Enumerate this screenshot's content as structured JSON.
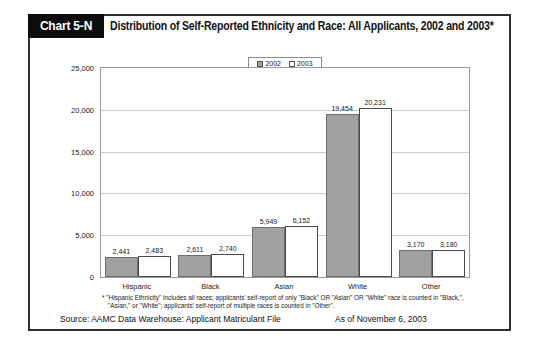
{
  "header": {
    "tab_label": "Chart 5-N",
    "title": "Distribution of Self-Reported Ethnicity and Race: All Applicants, 2002 and 2003*"
  },
  "chart_data": {
    "type": "bar",
    "categories": [
      "Hispanic",
      "Black",
      "Asian",
      "White",
      "Other"
    ],
    "series": [
      {
        "name": "2002",
        "color": "#a1a1a1",
        "values": [
          2441,
          2611,
          5949,
          19454,
          3170
        ]
      },
      {
        "name": "2003",
        "color": "#ffffff",
        "values": [
          2483,
          2740,
          6152,
          20231,
          3180
        ]
      }
    ],
    "title": "",
    "xlabel": "",
    "ylabel": "",
    "ylim": [
      0,
      25000
    ],
    "ytick_step": 5000,
    "grid": true,
    "legend_position": "top-center",
    "value_labels": true
  },
  "footnote": {
    "line1": "* \"Hispanic Ethnicity\" includes all races; applicants' self-report of only \"Black\" OR \"Asian\" OR \"White\" race is counted in \"Black,\",",
    "line2": "\"Asian,\" or \"White\"; applicants' self-report of multiple races is counted in \"Other\"."
  },
  "footer": {
    "source": "Source: AAMC Data Warehouse: Applicant Matriculant File",
    "as_of": "As of November 6, 2003"
  }
}
